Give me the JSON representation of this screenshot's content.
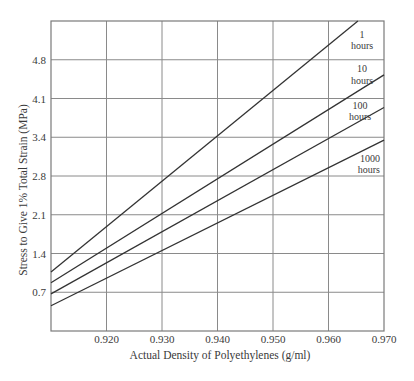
{
  "chart_data": {
    "type": "line",
    "title": "",
    "xlabel": "Actual Density of Polyethylenes (g/ml)",
    "ylabel": "Stress to Give 1% Total Strain (MPa)",
    "xlim": [
      0.91,
      0.97
    ],
    "ylim": [
      0,
      5.52
    ],
    "x_ticks": [
      0.92,
      0.93,
      0.94,
      0.95,
      0.96,
      0.97
    ],
    "x_tick_labels": [
      "0.920",
      "0.930",
      "0.940",
      "0.950",
      "0.960",
      "0.970"
    ],
    "y_ticks": [
      0.69,
      1.38,
      2.07,
      2.76,
      3.45,
      4.14,
      4.83
    ],
    "y_tick_labels": [
      "0.7",
      "1.4",
      "2.1",
      "2.8",
      "3.4",
      "4.1",
      "4.8"
    ],
    "grid": true,
    "legend_position": "inline labels at right end of each line",
    "values_note": "Line endpoints are estimated from pixel positions against the gridlines; they are approximate, not values printed on the chart.",
    "series": [
      {
        "name": "1 hours",
        "label_line1": "1",
        "label_line2": "hours",
        "x": [
          0.91,
          0.9653
        ],
        "y": [
          1.05,
          5.52
        ]
      },
      {
        "name": "10 hours",
        "label_line1": "10",
        "label_line2": "hours",
        "x": [
          0.91,
          0.97
        ],
        "y": [
          0.86,
          4.56
        ]
      },
      {
        "name": "100 hours",
        "label_line1": "100",
        "label_line2": "hours",
        "x": [
          0.91,
          0.97
        ],
        "y": [
          0.66,
          3.98
        ]
      },
      {
        "name": "1000 hours",
        "label_line1": "1000",
        "label_line2": "hours",
        "x": [
          0.91,
          0.97
        ],
        "y": [
          0.45,
          3.4
        ]
      }
    ]
  }
}
